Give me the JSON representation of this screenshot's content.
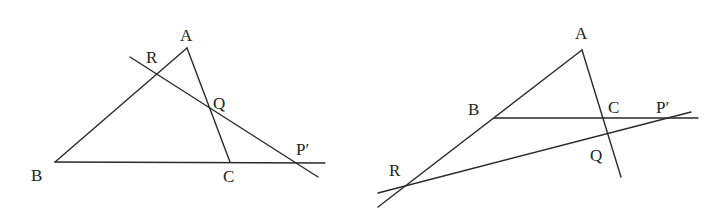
{
  "figures": [
    {
      "id": "left",
      "labels": {
        "A": "A",
        "B": "B",
        "C": "C",
        "R": "R",
        "Q": "Q",
        "P": "P′"
      },
      "points": {
        "A": [
          187,
          48
        ],
        "B": [
          55,
          162
        ],
        "C": [
          230,
          162
        ],
        "R": [
          157,
          75
        ],
        "Q": [
          209,
          107
        ],
        "P": [
          297,
          163
        ]
      },
      "lines": [
        {
          "name": "side-AB",
          "from": [
            55,
            162
          ],
          "to": [
            187,
            48
          ]
        },
        {
          "name": "side-AC",
          "from": [
            187,
            48
          ],
          "to": [
            230,
            162
          ]
        },
        {
          "name": "line-BC-extended",
          "from": [
            55,
            162
          ],
          "to": [
            325,
            163
          ]
        },
        {
          "name": "transversal",
          "from": [
            130,
            57
          ],
          "to": [
            318,
            177
          ]
        }
      ]
    },
    {
      "id": "right",
      "labels": {
        "A": "A",
        "B": "B",
        "C": "C",
        "R": "R",
        "Q": "Q",
        "P": "P′"
      },
      "points": {
        "A": [
          582,
          50
        ],
        "B": [
          494,
          118
        ],
        "C": [
          604,
          118
        ],
        "R": [
          402,
          187
        ],
        "Q": [
          608,
          134
        ],
        "P": [
          665,
          118
        ]
      },
      "lines": [
        {
          "name": "side-AB-extended",
          "from": [
            582,
            50
          ],
          "to": [
            378,
            207
          ]
        },
        {
          "name": "side-AC-extended",
          "from": [
            582,
            50
          ],
          "to": [
            621,
            177
          ]
        },
        {
          "name": "line-BC-extended",
          "from": [
            494,
            118
          ],
          "to": [
            698,
            118
          ]
        },
        {
          "name": "transversal",
          "from": [
            378,
            193
          ],
          "to": [
            691,
            112
          ]
        }
      ]
    }
  ],
  "colors": {
    "stroke": "#2a2a2a",
    "text": "#222222",
    "background": "#ffffff"
  }
}
